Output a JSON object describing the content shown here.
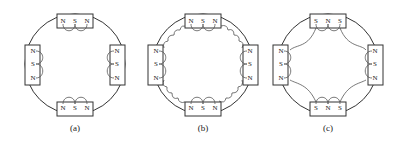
{
  "figure": {
    "panels": [
      {
        "id": "a",
        "caption": "(a)",
        "top_magnet": [
          "N",
          "S",
          "N"
        ],
        "bottom_magnet": [
          "N",
          "S",
          "N"
        ],
        "left_magnet": [
          "N",
          "S",
          "N"
        ],
        "right_magnet": [
          "N",
          "S",
          "N"
        ],
        "flux_description": "Local loops between adjacent poles within each magnet only"
      },
      {
        "id": "b",
        "caption": "(b)",
        "top_magnet": [
          "N",
          "S",
          "N"
        ],
        "bottom_magnet": [
          "N",
          "S",
          "N"
        ],
        "left_magnet": [
          "N",
          "S",
          "N"
        ],
        "right_magnet": [
          "N",
          "S",
          "N"
        ],
        "flux_description": "Local loops plus scalloped leakage flux linking neighbouring magnets"
      },
      {
        "id": "c",
        "caption": "(c)",
        "top_magnet": [
          "S",
          "N",
          "S"
        ],
        "bottom_magnet": [
          "S",
          "N",
          "S"
        ],
        "left_magnet": [
          "N",
          "S",
          "N"
        ],
        "right_magnet": [
          "N",
          "S",
          "N"
        ],
        "flux_description": "Local loops plus long flux arcs connecting adjacent magnets"
      }
    ],
    "colors": {
      "line": "#333333",
      "background": "#ffffff"
    }
  }
}
